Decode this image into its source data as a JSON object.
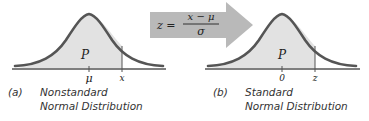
{
  "colors": {
    "curve_stroke": "#555555",
    "curve_fill": "#e2e2e2",
    "arrow_fill": "#b9b9b9",
    "axis": "#555555",
    "text": "#222222"
  },
  "arrow": {
    "formula_lhs": "z =",
    "formula_numerator": "x − μ",
    "formula_denominator": "σ"
  },
  "panels": [
    {
      "id": "a",
      "area_label": "P",
      "center_tick_label": "μ",
      "value_tick_label": "x",
      "caption_letter": "(a)",
      "caption_line1": "Nonstandard",
      "caption_line2": "Normal Distribution"
    },
    {
      "id": "b",
      "area_label": "P",
      "center_tick_label": "0",
      "value_tick_label": "z",
      "caption_letter": "(b)",
      "caption_line1": "Standard",
      "caption_line2": "Normal Distribution"
    }
  ]
}
